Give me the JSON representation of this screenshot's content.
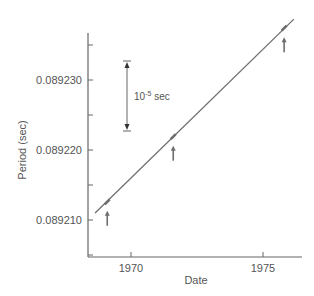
{
  "chart_data": {
    "type": "line",
    "title": "",
    "xlabel": "Date",
    "ylabel": "Period (sec)",
    "x_ticks": [
      1970,
      1975
    ],
    "x_tick_labels": [
      "1970",
      "1975"
    ],
    "y_ticks": [
      0.08921,
      0.08922,
      0.08923
    ],
    "y_tick_labels": [
      "0.089210",
      "0.089220",
      "0.089230"
    ],
    "y_minor_ticks": [
      0.089205,
      0.089215,
      0.089225,
      0.089235
    ],
    "xlim": [
      1968.35,
      1976.65
    ],
    "ylim": [
      0.089205,
      0.08924
    ],
    "grid": false,
    "legend": null,
    "series": [
      {
        "name": "Pulsar period fit",
        "x": [
          1968.64,
          1976.17
        ],
        "y": [
          0.089211,
          0.0892387
        ]
      }
    ],
    "marked_points": [
      {
        "x": 1969.1,
        "y": 0.0892126
      },
      {
        "x": 1971.6,
        "y": 0.0892219
      },
      {
        "x": 1975.8,
        "y": 0.0892374
      }
    ],
    "annotations": [
      {
        "type": "scale-bar",
        "label_base": "10",
        "label_exp": "-5",
        "label_unit": " sec",
        "magnitude": 1e-05
      }
    ]
  },
  "colors": {
    "axis": "#666666",
    "line": "#6e6e6e",
    "text": "#555555",
    "background": "#ffffff"
  }
}
